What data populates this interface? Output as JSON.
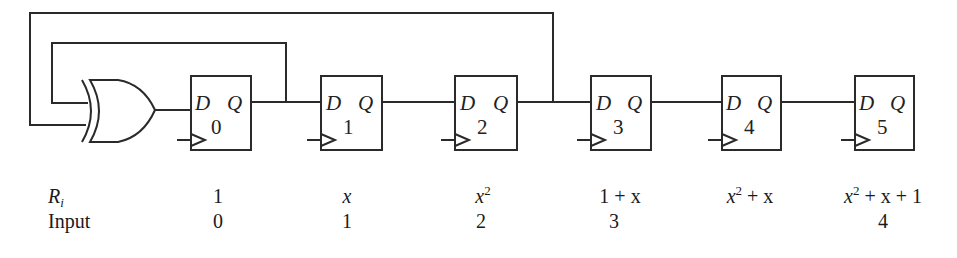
{
  "diagram": {
    "gate": {
      "type": "XOR",
      "label": ""
    },
    "flip_flops": [
      {
        "index": "0",
        "d_label": "D",
        "q_label": "Q"
      },
      {
        "index": "1",
        "d_label": "D",
        "q_label": "Q"
      },
      {
        "index": "2",
        "d_label": "D",
        "q_label": "Q"
      },
      {
        "index": "3",
        "d_label": "D",
        "q_label": "Q"
      },
      {
        "index": "4",
        "d_label": "D",
        "q_label": "Q"
      },
      {
        "index": "5",
        "d_label": "D",
        "q_label": "Q"
      }
    ],
    "feedback": [
      {
        "from": "Q0",
        "to": "XOR input A"
      },
      {
        "from": "Q2",
        "to": "XOR input B"
      }
    ]
  },
  "table": {
    "row_labels": {
      "ri": "R",
      "ri_sub": "i",
      "input": "Input"
    },
    "ri_values": [
      {
        "base": "1",
        "sup": "",
        "rest": ""
      },
      {
        "base": "x",
        "sup": "",
        "rest": ""
      },
      {
        "base": "x",
        "sup": "2",
        "rest": ""
      },
      {
        "base": "1 + x",
        "sup": "",
        "rest": ""
      },
      {
        "base": "x",
        "sup": "2",
        "rest": " + x"
      },
      {
        "base": "x",
        "sup": "2",
        "rest": " + x + 1"
      }
    ],
    "input_values": [
      "0",
      "1",
      "2",
      "3",
      "",
      "4"
    ]
  },
  "colors": {
    "line": "#2a2a2a",
    "text": "#1a1a1a",
    "background": "#ffffff"
  }
}
